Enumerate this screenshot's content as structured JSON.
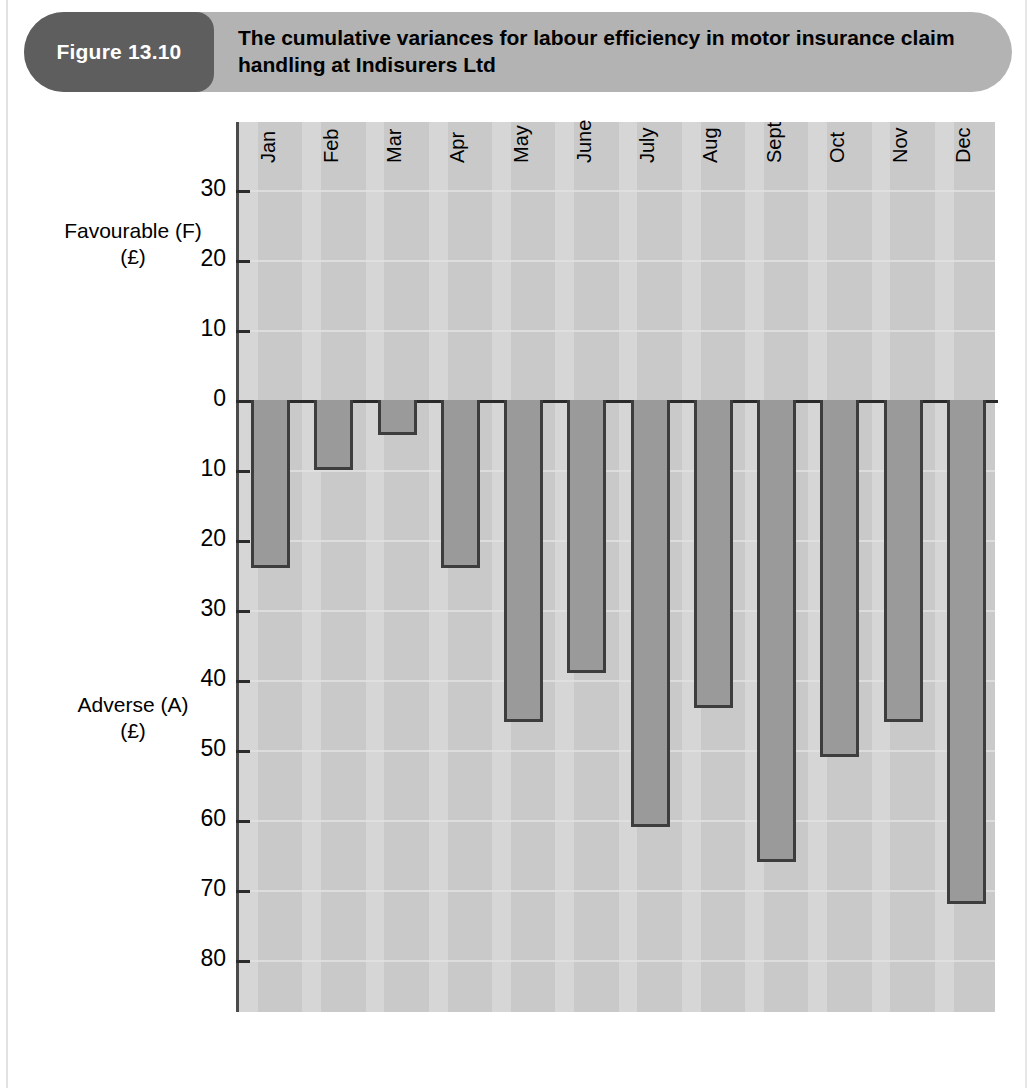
{
  "figure": {
    "tag_label": "Figure 13.10",
    "title": "The cumulative variances for labour efficiency in motor insurance claim handling at Indisurers Ltd"
  },
  "axis": {
    "favourable_caption_line1": "Favourable (F)",
    "favourable_caption_line2": "(£)",
    "adverse_caption_line1": "Adverse (A)",
    "adverse_caption_line2": "(£)",
    "tick_labels": [
      "30",
      "20",
      "10",
      "0",
      "10",
      "20",
      "30",
      "40",
      "50",
      "60",
      "70",
      "80"
    ]
  },
  "colors": {
    "banner": "#b3b3b3",
    "tag": "#5e5e5e",
    "plot_background": "#c9c9c9",
    "stripe_light": "#d6d6d6",
    "bar_fill": "#9a9a9a",
    "bar_outline": "#3d3d3d",
    "axis_line": "#2a2a2a"
  },
  "chart_data": {
    "type": "bar",
    "title": "The cumulative variances for labour efficiency in motor insurance claim handling at Indisurers Ltd",
    "xlabel": "",
    "ylabel": "Favourable (F) / Adverse (A) (£)",
    "categories": [
      "Jan",
      "Feb",
      "Mar",
      "Apr",
      "May",
      "June",
      "July",
      "Aug",
      "Sept",
      "Oct",
      "Nov",
      "Dec"
    ],
    "values": [
      -24,
      -10,
      -5,
      -24,
      -46,
      -39,
      -61,
      -44,
      -66,
      -51,
      -46,
      -72
    ],
    "value_labels": [
      "24",
      "10",
      "5",
      "24",
      "46",
      "39",
      "61",
      "44",
      "66",
      "51",
      "46",
      "72"
    ],
    "ylim": [
      -85,
      35
    ],
    "y_ticks": [
      30,
      20,
      10,
      0,
      -10,
      -20,
      -30,
      -40,
      -50,
      -60,
      -70,
      -80
    ],
    "y_tick_display": [
      "30",
      "20",
      "10",
      "0",
      "10",
      "20",
      "30",
      "40",
      "50",
      "60",
      "70",
      "80"
    ],
    "grid": true,
    "legend": false,
    "orientation": "vertical",
    "note": "Negative values are plotted downward and labelled as Adverse (A); positive upward would be Favourable (F)."
  }
}
